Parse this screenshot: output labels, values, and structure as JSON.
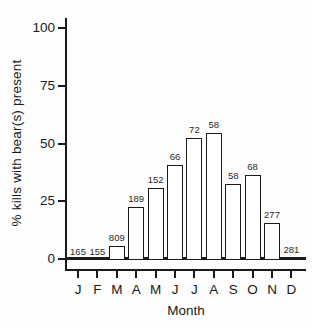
{
  "chart_data": {
    "type": "bar",
    "title": "",
    "xlabel": "Month",
    "ylabel": "% kills with bear(s) present",
    "categories": [
      "J",
      "F",
      "M",
      "A",
      "M",
      "J",
      "J",
      "A",
      "S",
      "O",
      "N",
      "D"
    ],
    "values": [
      0,
      0,
      6,
      23,
      31,
      41,
      53,
      55,
      33,
      37,
      16,
      1
    ],
    "bar_labels": [
      "165",
      "155",
      "809",
      "189",
      "152",
      "66",
      "72",
      "58",
      "58",
      "68",
      "277",
      "281"
    ],
    "yticks": [
      0,
      25,
      50,
      75,
      100
    ],
    "ylim": [
      0,
      100
    ],
    "legend": null,
    "grid": false,
    "bar_fill_color": "#ffffff",
    "bar_border_color": "#1a1a1a",
    "axis_color": "#1a1a1a"
  }
}
